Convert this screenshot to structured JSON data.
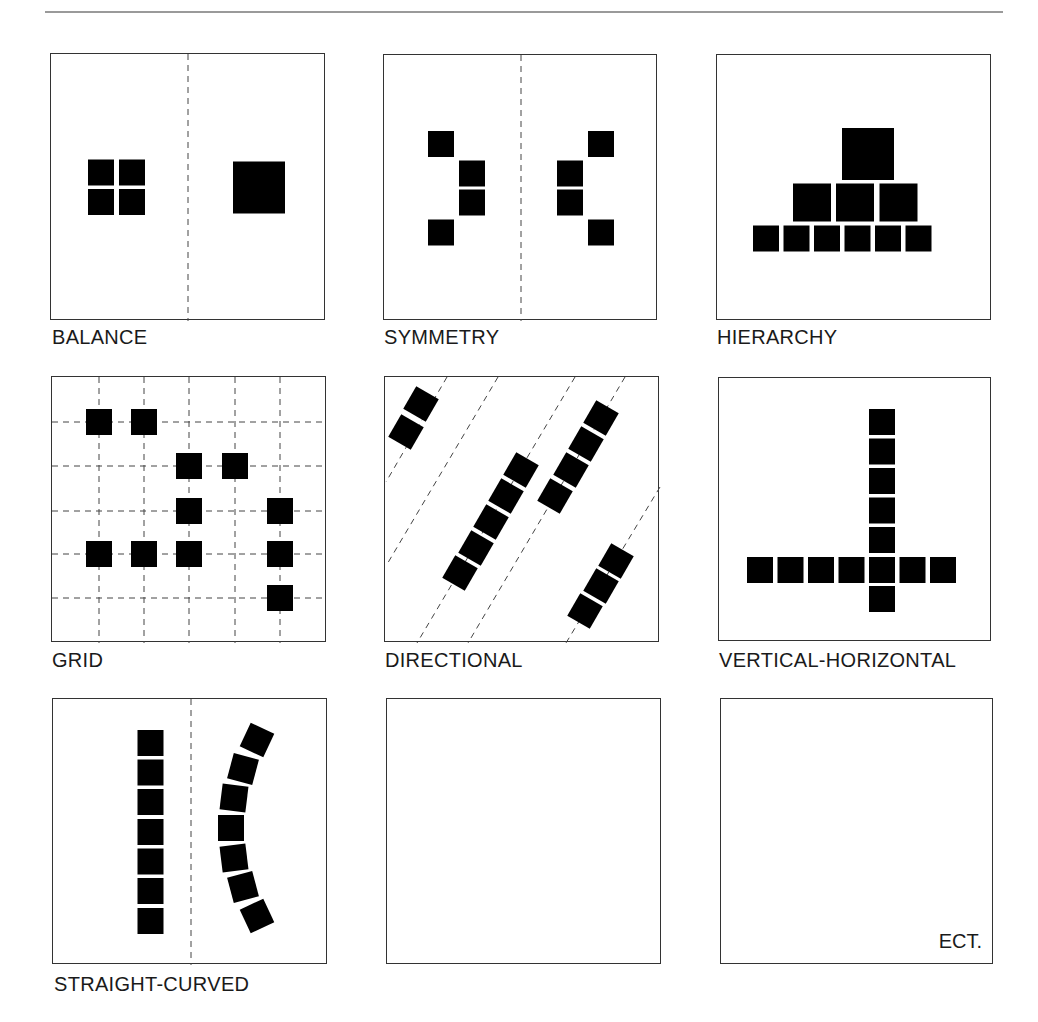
{
  "header": {
    "title_fragment": ""
  },
  "colors": {
    "ink": "#000000",
    "border": "#333333",
    "dash": "#444444",
    "rule": "#9a9a9a",
    "text": "#1a1a1a"
  },
  "square_size": 26,
  "panels": [
    {
      "id": "balance",
      "label": "BALANCE",
      "box": {
        "x": 50,
        "y": 53,
        "w": 275,
        "h": 267
      },
      "label_pos": {
        "x": 52,
        "y": 327
      },
      "dashed_lines": [
        {
          "x1": 137,
          "y1": 0,
          "x2": 137,
          "y2": 267
        }
      ],
      "squares": [
        {
          "cx": 50,
          "cy": 118.5,
          "s": 26
        },
        {
          "cx": 81,
          "cy": 118.5,
          "s": 26
        },
        {
          "cx": 50,
          "cy": 148,
          "s": 26
        },
        {
          "cx": 81,
          "cy": 148,
          "s": 26
        },
        {
          "cx": 208,
          "cy": 133.5,
          "s": 52
        }
      ]
    },
    {
      "id": "symmetry",
      "label": "SYMMETRY",
      "box": {
        "x": 383,
        "y": 54,
        "w": 274,
        "h": 266
      },
      "label_pos": {
        "x": 384,
        "y": 327
      },
      "dashed_lines": [
        {
          "x1": 137,
          "y1": 0,
          "x2": 137,
          "y2": 266
        }
      ],
      "squares": [
        {
          "cx": 57,
          "cy": 89,
          "s": 26
        },
        {
          "cx": 88,
          "cy": 118.5,
          "s": 26
        },
        {
          "cx": 88,
          "cy": 147.5,
          "s": 26
        },
        {
          "cx": 57,
          "cy": 177.5,
          "s": 26
        },
        {
          "cx": 186,
          "cy": 118.5,
          "s": 26
        },
        {
          "cx": 186,
          "cy": 147.5,
          "s": 26
        },
        {
          "cx": 217,
          "cy": 89,
          "s": 26
        },
        {
          "cx": 217,
          "cy": 177.5,
          "s": 26
        }
      ]
    },
    {
      "id": "hierarchy",
      "label": "HIERARCHY",
      "box": {
        "x": 716,
        "y": 54,
        "w": 275,
        "h": 266
      },
      "label_pos": {
        "x": 717,
        "y": 327
      },
      "dashed_lines": [],
      "squares": [
        {
          "cx": 151,
          "cy": 99,
          "s": 52
        },
        {
          "cx": 95,
          "cy": 147.5,
          "s": 38
        },
        {
          "cx": 138,
          "cy": 147.5,
          "s": 38
        },
        {
          "cx": 181.5,
          "cy": 147.5,
          "s": 38
        },
        {
          "cx": 49,
          "cy": 183.5,
          "s": 26
        },
        {
          "cx": 79.5,
          "cy": 183.5,
          "s": 26
        },
        {
          "cx": 110,
          "cy": 183.5,
          "s": 26
        },
        {
          "cx": 140.5,
          "cy": 183.5,
          "s": 26
        },
        {
          "cx": 171,
          "cy": 183.5,
          "s": 26
        },
        {
          "cx": 201.5,
          "cy": 183.5,
          "s": 26
        }
      ]
    },
    {
      "id": "grid",
      "label": "GRID",
      "box": {
        "x": 51,
        "y": 376,
        "w": 275,
        "h": 266
      },
      "label_pos": {
        "x": 52,
        "y": 650
      },
      "dashed_lines": [
        {
          "x1": 47,
          "y1": 0,
          "x2": 47,
          "y2": 266
        },
        {
          "x1": 92,
          "y1": 0,
          "x2": 92,
          "y2": 266
        },
        {
          "x1": 137,
          "y1": 0,
          "x2": 137,
          "y2": 266
        },
        {
          "x1": 183,
          "y1": 0,
          "x2": 183,
          "y2": 266
        },
        {
          "x1": 228,
          "y1": 0,
          "x2": 228,
          "y2": 266
        },
        {
          "x1": 0,
          "y1": 45,
          "x2": 275,
          "y2": 45
        },
        {
          "x1": 0,
          "y1": 89,
          "x2": 275,
          "y2": 89
        },
        {
          "x1": 0,
          "y1": 134,
          "x2": 275,
          "y2": 134
        },
        {
          "x1": 0,
          "y1": 177,
          "x2": 275,
          "y2": 177
        },
        {
          "x1": 0,
          "y1": 221,
          "x2": 275,
          "y2": 221
        }
      ],
      "squares": [
        {
          "cx": 47,
          "cy": 45,
          "s": 26
        },
        {
          "cx": 92,
          "cy": 45,
          "s": 26
        },
        {
          "cx": 137,
          "cy": 89,
          "s": 26
        },
        {
          "cx": 183,
          "cy": 89,
          "s": 26
        },
        {
          "cx": 137,
          "cy": 134,
          "s": 26
        },
        {
          "cx": 228,
          "cy": 134,
          "s": 26
        },
        {
          "cx": 47,
          "cy": 177,
          "s": 26
        },
        {
          "cx": 92,
          "cy": 177,
          "s": 26
        },
        {
          "cx": 137,
          "cy": 177,
          "s": 26
        },
        {
          "cx": 228,
          "cy": 177,
          "s": 26
        },
        {
          "cx": 228,
          "cy": 221,
          "s": 26
        }
      ]
    },
    {
      "id": "directional",
      "label": "DIRECTIONAL",
      "box": {
        "x": 384,
        "y": 376,
        "w": 275,
        "h": 266
      },
      "label_pos": {
        "x": 385,
        "y": 650
      },
      "dashed_lines": [
        {
          "x1": 62,
          "y1": 0,
          "x2": 1,
          "y2": 105
        },
        {
          "x1": 113,
          "y1": 0,
          "x2": 1,
          "y2": 189
        },
        {
          "x1": 190,
          "y1": 0,
          "x2": 32,
          "y2": 266
        },
        {
          "x1": 240,
          "y1": 0,
          "x2": 83,
          "y2": 266
        },
        {
          "x1": 275,
          "y1": 110,
          "x2": 181,
          "y2": 266
        }
      ],
      "squares": [
        {
          "cx": 36,
          "cy": 27,
          "s": 26,
          "rot": 30
        },
        {
          "cx": 21,
          "cy": 55,
          "s": 26,
          "rot": 30
        },
        {
          "cx": 136,
          "cy": 93,
          "s": 26,
          "rot": 30
        },
        {
          "cx": 121,
          "cy": 119,
          "s": 26,
          "rot": 30
        },
        {
          "cx": 106,
          "cy": 145,
          "s": 26,
          "rot": 30
        },
        {
          "cx": 91,
          "cy": 171,
          "s": 26,
          "rot": 30
        },
        {
          "cx": 75,
          "cy": 196,
          "s": 26,
          "rot": 30
        },
        {
          "cx": 216,
          "cy": 41,
          "s": 26,
          "rot": 30
        },
        {
          "cx": 201,
          "cy": 67,
          "s": 26,
          "rot": 30
        },
        {
          "cx": 186,
          "cy": 93,
          "s": 26,
          "rot": 30
        },
        {
          "cx": 170,
          "cy": 119,
          "s": 26,
          "rot": 30
        },
        {
          "cx": 231,
          "cy": 184,
          "s": 26,
          "rot": 30
        },
        {
          "cx": 216,
          "cy": 209,
          "s": 26,
          "rot": 30
        },
        {
          "cx": 200,
          "cy": 234,
          "s": 26,
          "rot": 30
        }
      ]
    },
    {
      "id": "vertical-horizontal",
      "label": "VERTICAL-HORIZONTAL",
      "box": {
        "x": 718,
        "y": 377,
        "w": 273,
        "h": 264
      },
      "label_pos": {
        "x": 719,
        "y": 650
      },
      "dashed_lines": [],
      "squares": [
        {
          "cx": 163,
          "cy": 44,
          "s": 26
        },
        {
          "cx": 163,
          "cy": 73.5,
          "s": 26
        },
        {
          "cx": 163,
          "cy": 103,
          "s": 26
        },
        {
          "cx": 163,
          "cy": 132.5,
          "s": 26
        },
        {
          "cx": 163,
          "cy": 162,
          "s": 26
        },
        {
          "cx": 163,
          "cy": 221,
          "s": 26
        },
        {
          "cx": 41,
          "cy": 192,
          "s": 26
        },
        {
          "cx": 71.5,
          "cy": 192,
          "s": 26
        },
        {
          "cx": 102,
          "cy": 192,
          "s": 26
        },
        {
          "cx": 132.5,
          "cy": 192,
          "s": 26
        },
        {
          "cx": 163,
          "cy": 192,
          "s": 26
        },
        {
          "cx": 193.5,
          "cy": 192,
          "s": 26
        },
        {
          "cx": 224,
          "cy": 192,
          "s": 26
        }
      ]
    },
    {
      "id": "straight-curved",
      "label": "STRAIGHT-CURVED",
      "box": {
        "x": 52,
        "y": 698,
        "w": 275,
        "h": 266
      },
      "label_pos": {
        "x": 54,
        "y": 974
      },
      "dashed_lines": [
        {
          "x1": 138,
          "y1": 0,
          "x2": 138,
          "y2": 266
        }
      ],
      "squares": [
        {
          "cx": 97.5,
          "cy": 44,
          "s": 26
        },
        {
          "cx": 97.5,
          "cy": 73.5,
          "s": 26
        },
        {
          "cx": 97.5,
          "cy": 103,
          "s": 26
        },
        {
          "cx": 97.5,
          "cy": 133,
          "s": 26
        },
        {
          "cx": 97.5,
          "cy": 162.5,
          "s": 26
        },
        {
          "cx": 97.5,
          "cy": 192,
          "s": 26
        },
        {
          "cx": 97.5,
          "cy": 222,
          "s": 26
        },
        {
          "cx": 204,
          "cy": 41,
          "s": 26,
          "rot": 25
        },
        {
          "cx": 190,
          "cy": 70,
          "s": 26,
          "rot": 15
        },
        {
          "cx": 181,
          "cy": 99,
          "s": 26,
          "rot": 7
        },
        {
          "cx": 178,
          "cy": 129,
          "s": 26,
          "rot": 0
        },
        {
          "cx": 181,
          "cy": 159,
          "s": 26,
          "rot": -7
        },
        {
          "cx": 190,
          "cy": 188,
          "s": 26,
          "rot": -15
        },
        {
          "cx": 204,
          "cy": 217,
          "s": 26,
          "rot": -25
        }
      ]
    },
    {
      "id": "empty",
      "label": "",
      "box": {
        "x": 386,
        "y": 698,
        "w": 275,
        "h": 266
      },
      "label_pos": {
        "x": 386,
        "y": 974
      },
      "dashed_lines": [],
      "squares": []
    },
    {
      "id": "etc",
      "label": "",
      "inner_label": "ECT.",
      "inner_label_pos": {
        "right": 10,
        "bottom": 12
      },
      "box": {
        "x": 720,
        "y": 698,
        "w": 273,
        "h": 266
      },
      "label_pos": {
        "x": 720,
        "y": 974
      },
      "dashed_lines": [],
      "squares": []
    }
  ]
}
